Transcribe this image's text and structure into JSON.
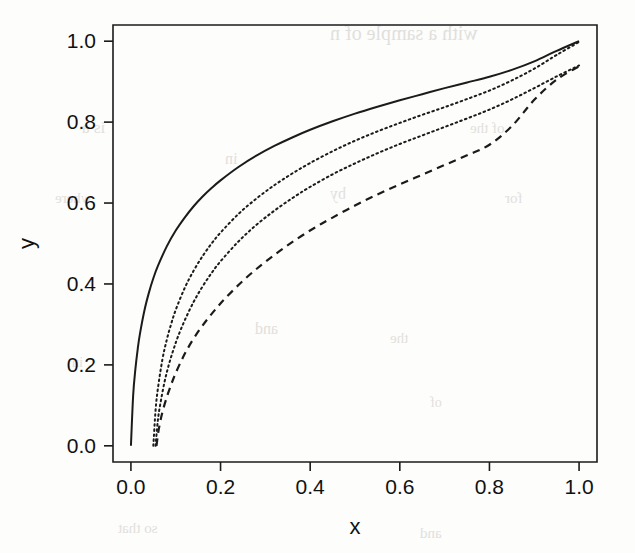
{
  "figure": {
    "background_color": "#fdfdfc",
    "ink_color": "#1b1b1b",
    "scan_artifact_color": "#d8d6d2"
  },
  "bleed_through_text": {
    "note": "faint reversed text bleeding through the scanned page",
    "lines": [
      {
        "text": "with a sample of n",
        "x": 330,
        "y": 22,
        "size": 20
      },
      {
        "text": "is a",
        "x": 82,
        "y": 118,
        "size": 17
      },
      {
        "text": "in",
        "x": 225,
        "y": 150,
        "size": 16
      },
      {
        "text": "by",
        "x": 330,
        "y": 185,
        "size": 16
      },
      {
        "text": "where",
        "x": 55,
        "y": 190,
        "size": 15
      },
      {
        "text": "of the",
        "x": 470,
        "y": 120,
        "size": 15
      },
      {
        "text": "for",
        "x": 505,
        "y": 190,
        "size": 15
      },
      {
        "text": "and",
        "x": 255,
        "y": 320,
        "size": 16
      },
      {
        "text": "the",
        "x": 390,
        "y": 330,
        "size": 15
      },
      {
        "text": "in",
        "x": 72,
        "y": 355,
        "size": 14
      },
      {
        "text": "of",
        "x": 430,
        "y": 395,
        "size": 14
      },
      {
        "text": "so that",
        "x": 118,
        "y": 520,
        "size": 15
      },
      {
        "text": "and",
        "x": 420,
        "y": 525,
        "size": 15
      }
    ]
  },
  "chart_data": {
    "type": "line",
    "title": "",
    "subtitle": "",
    "xlabel": "x",
    "ylabel": "y",
    "xlim": [
      -0.04,
      1.04
    ],
    "ylim": [
      -0.04,
      1.04
    ],
    "grid": false,
    "legend": false,
    "legend_position": "none",
    "frame": true,
    "x_ticks": [
      0.0,
      0.2,
      0.4,
      0.6,
      0.8,
      1.0
    ],
    "x_tick_labels": [
      "0.0",
      "0.2",
      "0.4",
      "0.6",
      "0.8",
      "1.0"
    ],
    "y_ticks": [
      0.0,
      0.2,
      0.4,
      0.6,
      0.8,
      1.0
    ],
    "y_tick_labels": [
      "0.0",
      "0.2",
      "0.4",
      "0.6",
      "0.8",
      "1.0"
    ],
    "series": [
      {
        "name": "curve-1",
        "style": "solid",
        "color": "#1b1b1b",
        "x": [
          0.0,
          0.005,
          0.01,
          0.015,
          0.02,
          0.03,
          0.04,
          0.05,
          0.06,
          0.08,
          0.1,
          0.12,
          0.14,
          0.16,
          0.18,
          0.2,
          0.24,
          0.28,
          0.32,
          0.36,
          0.4,
          0.45,
          0.5,
          0.55,
          0.6,
          0.65,
          0.7,
          0.75,
          0.8,
          0.85,
          0.9,
          0.95,
          1.0
        ],
        "y": [
          0.0,
          0.125,
          0.19,
          0.238,
          0.276,
          0.334,
          0.378,
          0.414,
          0.444,
          0.493,
          0.532,
          0.564,
          0.592,
          0.616,
          0.637,
          0.656,
          0.689,
          0.717,
          0.741,
          0.762,
          0.781,
          0.802,
          0.821,
          0.838,
          0.854,
          0.869,
          0.884,
          0.898,
          0.912,
          0.929,
          0.95,
          0.976,
          1.0
        ]
      },
      {
        "name": "curve-2",
        "style": "dotted",
        "color": "#1b1b1b",
        "x": [
          0.05,
          0.055,
          0.06,
          0.07,
          0.08,
          0.09,
          0.1,
          0.12,
          0.14,
          0.16,
          0.18,
          0.2,
          0.24,
          0.28,
          0.32,
          0.36,
          0.4,
          0.45,
          0.5,
          0.55,
          0.6,
          0.65,
          0.7,
          0.75,
          0.8,
          0.85,
          0.9,
          0.95,
          1.0
        ],
        "y": [
          0.0,
          0.088,
          0.14,
          0.212,
          0.262,
          0.302,
          0.336,
          0.39,
          0.433,
          0.469,
          0.5,
          0.527,
          0.573,
          0.611,
          0.644,
          0.673,
          0.699,
          0.728,
          0.754,
          0.777,
          0.798,
          0.818,
          0.837,
          0.857,
          0.878,
          0.903,
          0.932,
          0.966,
          0.998
        ]
      },
      {
        "name": "curve-3",
        "style": "dotted",
        "color": "#1b1b1b",
        "x": [
          0.055,
          0.06,
          0.065,
          0.075,
          0.085,
          0.095,
          0.105,
          0.12,
          0.14,
          0.16,
          0.18,
          0.2,
          0.24,
          0.28,
          0.32,
          0.36,
          0.4,
          0.45,
          0.5,
          0.55,
          0.6,
          0.65,
          0.7,
          0.75,
          0.8,
          0.85,
          0.9,
          0.95,
          1.0
        ],
        "y": [
          0.0,
          0.062,
          0.1,
          0.158,
          0.202,
          0.238,
          0.27,
          0.31,
          0.356,
          0.394,
          0.427,
          0.456,
          0.505,
          0.546,
          0.581,
          0.612,
          0.64,
          0.671,
          0.698,
          0.723,
          0.746,
          0.767,
          0.788,
          0.809,
          0.831,
          0.856,
          0.884,
          0.913,
          0.94
        ]
      },
      {
        "name": "curve-4",
        "style": "dashed",
        "color": "#1b1b1b",
        "x": [
          0.057,
          0.062,
          0.07,
          0.08,
          0.09,
          0.1,
          0.115,
          0.13,
          0.15,
          0.17,
          0.19,
          0.21,
          0.25,
          0.29,
          0.33,
          0.37,
          0.41,
          0.45,
          0.5,
          0.55,
          0.6,
          0.65,
          0.7,
          0.75,
          0.8,
          0.85,
          0.9,
          0.95,
          1.0
        ],
        "y": [
          0.0,
          0.04,
          0.082,
          0.12,
          0.152,
          0.18,
          0.216,
          0.247,
          0.282,
          0.312,
          0.339,
          0.364,
          0.408,
          0.446,
          0.48,
          0.511,
          0.539,
          0.564,
          0.594,
          0.621,
          0.646,
          0.67,
          0.694,
          0.718,
          0.744,
          0.79,
          0.855,
          0.905,
          0.938
        ]
      }
    ]
  }
}
